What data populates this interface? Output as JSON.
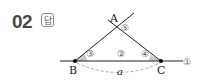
{
  "problem": {
    "number": "02",
    "answer_badge": "답"
  },
  "figure": {
    "points": {
      "A": "A",
      "B": "B",
      "C": "C"
    },
    "length_label": "a",
    "markers": {
      "m1": "①",
      "m2": "②",
      "m3": "③",
      "m4": "④",
      "m5": "⑤"
    },
    "colors": {
      "line": "#222222",
      "angle_fill": "#c8c8c8",
      "dashed": "#999999"
    }
  }
}
